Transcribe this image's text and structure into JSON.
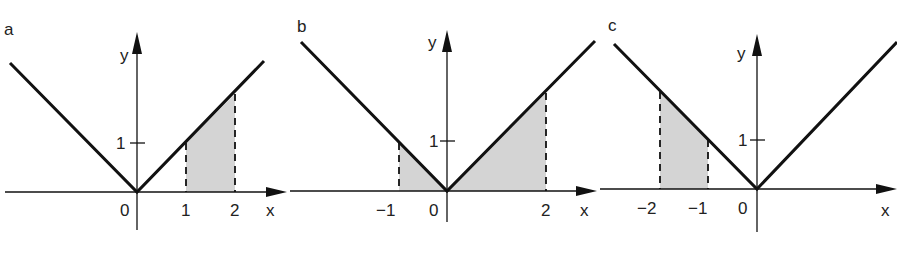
{
  "function": "y = |x|",
  "panels": [
    {
      "label": "a",
      "shaded_interval": [
        1,
        2
      ],
      "x_ticks": [
        {
          "value": 0,
          "label": "0"
        },
        {
          "value": 1,
          "label": "1"
        },
        {
          "value": 2,
          "label": "2"
        }
      ],
      "y_ticks": [
        {
          "value": 1,
          "label": "1"
        }
      ],
      "x_axis_label": "x",
      "y_axis_label": "y"
    },
    {
      "label": "b",
      "shaded_interval": [
        -1,
        2
      ],
      "x_ticks": [
        {
          "value": -1,
          "label": "−1"
        },
        {
          "value": 0,
          "label": "0"
        },
        {
          "value": 2,
          "label": "2"
        }
      ],
      "y_ticks": [
        {
          "value": 1,
          "label": "1"
        }
      ],
      "x_axis_label": "x",
      "y_axis_label": "y"
    },
    {
      "label": "c",
      "shaded_interval": [
        -2,
        -1
      ],
      "x_ticks": [
        {
          "value": -2,
          "label": "−2"
        },
        {
          "value": -1,
          "label": "−1"
        },
        {
          "value": 0,
          "label": "0"
        }
      ],
      "y_ticks": [
        {
          "value": 1,
          "label": "1"
        }
      ],
      "x_axis_label": "x",
      "y_axis_label": "y"
    }
  ],
  "colors": {
    "line": "#111111",
    "shade": "#d4d4d4"
  }
}
